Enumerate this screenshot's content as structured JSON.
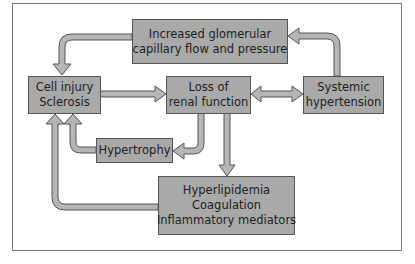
{
  "diagram": {
    "nodes": {
      "glomerular": {
        "lines": [
          "Increased glomerular",
          "capillary flow and pressure"
        ]
      },
      "cell_injury": {
        "lines": [
          "Cell injury",
          "Sclerosis"
        ]
      },
      "loss_renal": {
        "lines": [
          "Loss of",
          "renal function"
        ]
      },
      "systemic": {
        "lines": [
          "Systemic",
          "hypertension"
        ]
      },
      "hypertrophy": {
        "lines": [
          "Hypertrophy"
        ]
      },
      "hyperlipidemia": {
        "lines": [
          "Hyperlipidemia",
          "Coagulation",
          "Inflammatory mediators"
        ]
      }
    },
    "edges": [
      {
        "from": "glomerular",
        "to": "cell_injury"
      },
      {
        "from": "systemic",
        "to": "glomerular"
      },
      {
        "from": "cell_injury",
        "to": "loss_renal"
      },
      {
        "from": "loss_renal",
        "to": "systemic",
        "bidirectional": true
      },
      {
        "from": "loss_renal",
        "to": "hypertrophy"
      },
      {
        "from": "hypertrophy",
        "to": "cell_injury"
      },
      {
        "from": "loss_renal",
        "to": "hyperlipidemia"
      },
      {
        "from": "hyperlipidemia",
        "to": "cell_injury"
      }
    ],
    "colors": {
      "box_fill": "#a9a9a9",
      "box_border": "#555555",
      "arrow_fill": "#b3b3b3",
      "arrow_stroke": "#555555"
    }
  }
}
